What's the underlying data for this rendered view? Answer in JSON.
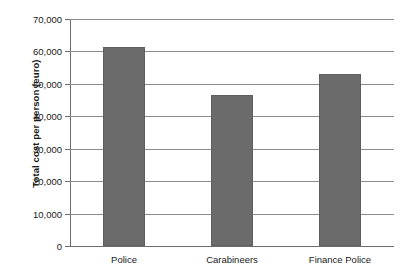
{
  "chart_data": {
    "type": "bar",
    "title": "",
    "subtitle": "",
    "xlabel": "",
    "ylabel": "Total cost per person (euro)",
    "categories": [
      "Police",
      "Carabineers",
      "Finance Police"
    ],
    "values": [
      61500,
      46500,
      53000
    ],
    "series": [
      {
        "name": "Total cost per person",
        "values": [
          61500,
          46500,
          53000
        ]
      }
    ],
    "ylim": [
      0,
      70000
    ],
    "ytick_values": [
      0,
      10000,
      20000,
      30000,
      40000,
      50000,
      60000,
      70000
    ],
    "ytick_labels": [
      "0",
      "10,000",
      "20,000",
      "30,000",
      "40,000",
      "50,000",
      "60,000",
      "70,000"
    ],
    "grid": true,
    "grid_axis": "y",
    "legend": false,
    "legend_position": "none",
    "bar_color": "#6b6b6b",
    "grid_color": "#8c8c8c",
    "axis_color": "#6e6e6e",
    "background_color": "#ffffff",
    "text_color": "#1a1a1a",
    "annotations": []
  }
}
